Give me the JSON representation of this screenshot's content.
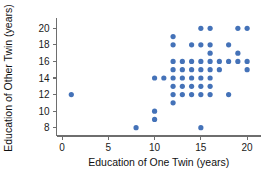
{
  "chart_data": {
    "type": "scatter",
    "title": "",
    "xlabel": "Education of One Twin (years)",
    "ylabel": "Education of Other Twin (years)",
    "xlim": [
      -0.6,
      21.5
    ],
    "ylim": [
      7.0,
      21.0
    ],
    "xticks": [
      0,
      5,
      10,
      15,
      20
    ],
    "xticklabels": [
      "0",
      "5",
      "10",
      "15",
      "20"
    ],
    "yticks": [
      8,
      10,
      12,
      14,
      16,
      18,
      20
    ],
    "yticklabels": [
      "8",
      "10",
      "12",
      "14",
      "16",
      "18",
      "20"
    ],
    "grid": false,
    "legend": null,
    "marker": "circle",
    "marker_color": "#4472b8",
    "marker_size": 2.6,
    "points": [
      [
        1,
        12
      ],
      [
        8,
        8
      ],
      [
        10,
        9
      ],
      [
        10,
        10
      ],
      [
        10,
        14
      ],
      [
        11,
        14
      ],
      [
        12,
        11
      ],
      [
        12,
        12
      ],
      [
        12,
        13
      ],
      [
        12,
        14
      ],
      [
        12,
        15
      ],
      [
        12,
        16
      ],
      [
        12,
        18
      ],
      [
        12,
        19
      ],
      [
        13,
        12
      ],
      [
        13,
        13
      ],
      [
        13,
        14
      ],
      [
        13,
        15
      ],
      [
        13,
        16
      ],
      [
        14,
        12
      ],
      [
        14,
        13
      ],
      [
        14,
        14
      ],
      [
        14,
        15
      ],
      [
        14,
        16
      ],
      [
        14,
        18
      ],
      [
        15,
        8
      ],
      [
        15,
        12
      ],
      [
        15,
        13
      ],
      [
        15,
        14
      ],
      [
        15,
        15
      ],
      [
        15,
        16
      ],
      [
        15,
        18
      ],
      [
        15,
        20
      ],
      [
        16,
        12
      ],
      [
        16,
        13
      ],
      [
        16,
        14
      ],
      [
        16,
        15
      ],
      [
        16,
        16
      ],
      [
        16,
        17
      ],
      [
        16,
        18
      ],
      [
        16,
        20
      ],
      [
        17,
        15
      ],
      [
        17,
        16
      ],
      [
        18,
        12
      ],
      [
        18,
        16
      ],
      [
        18,
        18
      ],
      [
        19,
        16
      ],
      [
        19,
        17
      ],
      [
        19,
        20
      ],
      [
        20,
        15
      ],
      [
        20,
        16
      ],
      [
        20,
        20
      ]
    ]
  },
  "axes": {
    "x_title": "Education of One Twin (years)",
    "y_title": "Education of Other Twin (years)"
  }
}
